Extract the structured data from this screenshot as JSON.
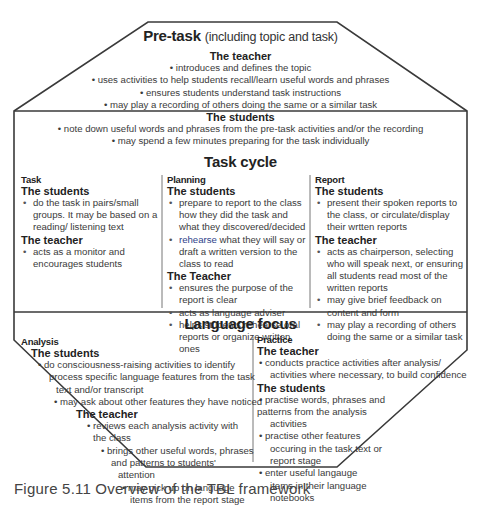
{
  "pre_task": {
    "title": "Pre-task",
    "subtitle": "(including topic and task)",
    "teacher_heading": "The teacher",
    "teacher_items": [
      "• introduces and defines the topic",
      "• uses activities to help students recall/learn useful words and phrases",
      "• ensures students understand task instructions",
      "• may play a recording of others doing the same or a similar task"
    ],
    "students_heading": "The students",
    "students_items": [
      "• note down useful words and phrases from the pre-task activities and/or the recording",
      "• may spend a few minutes preparing for the task individually"
    ]
  },
  "task_cycle": {
    "title": "Task cycle",
    "columns": [
      {
        "title": "Task",
        "groups": [
          {
            "heading": "The students",
            "items": [
              "do the task in pairs/small groups. It may be based on a reading/ listening text"
            ]
          },
          {
            "heading": "The teacher",
            "items": [
              "acts as a monitor and encourages students"
            ]
          }
        ]
      },
      {
        "title": "Planning",
        "groups": [
          {
            "heading": "The students",
            "items": [
              "prepare to report to the class how they did the task and what they discovered/decided",
              "what they will say or draft a written version to the class to read"
            ],
            "highlight_word": "rehearse"
          },
          {
            "heading": "The Teacher",
            "items": [
              "ensures the purpose of the report is clear",
              "acts as language adviser",
              "helps students rehearse oral reports or organize written ones"
            ]
          }
        ]
      },
      {
        "title": "Report",
        "groups": [
          {
            "heading": "The students",
            "items": [
              "present their spoken reports to the class, or circulate/display their wrtten reports"
            ]
          },
          {
            "heading": "The teacher",
            "items": [
              "acts as chairperson, selecting who will speak next, or ensuring all students read most of the written reports",
              "may give brief feedback on content and form",
              "may play a recording of others doing the same or a similar task"
            ]
          }
        ]
      }
    ]
  },
  "language_focus": {
    "title": "Language focus",
    "analysis": {
      "title": "Analysis",
      "students_heading": "The students",
      "students_lines": [
        "• do consciousness-raising activities to identify",
        "process specific language features from the task",
        "text and/or transcript",
        "•   may ask about other features they have noticed"
      ],
      "teacher_heading": "The teacher",
      "teacher_lines": [
        "• reviews each analysis activity with",
        "the class",
        "• brings other useful words, phrases",
        "and patterns to students'",
        "attention",
        "• may pick up on language",
        "items from the report stage"
      ]
    },
    "practice": {
      "title": "Practice",
      "teacher_heading": "The teacher",
      "teacher_lines": [
        "•  conducts practice activities after analysis/",
        "activities where necessary, to build confidence"
      ],
      "students_heading": "The students",
      "students_lines": [
        "•  practise words, phrases and",
        "patterns from the analysis",
        "activities",
        "•  practise other features",
        "occuring in the task text or",
        "report stage",
        "•  enter useful langauge",
        "items in their language",
        "notebooks"
      ]
    }
  },
  "caption": {
    "label": "Figure 5.11",
    "text": "Overview of the TBL framework"
  },
  "colors": {
    "line": "#3a3a3a",
    "text": "#3a3a3a",
    "heading": "#222222",
    "highlight": "#2f3f8a"
  }
}
